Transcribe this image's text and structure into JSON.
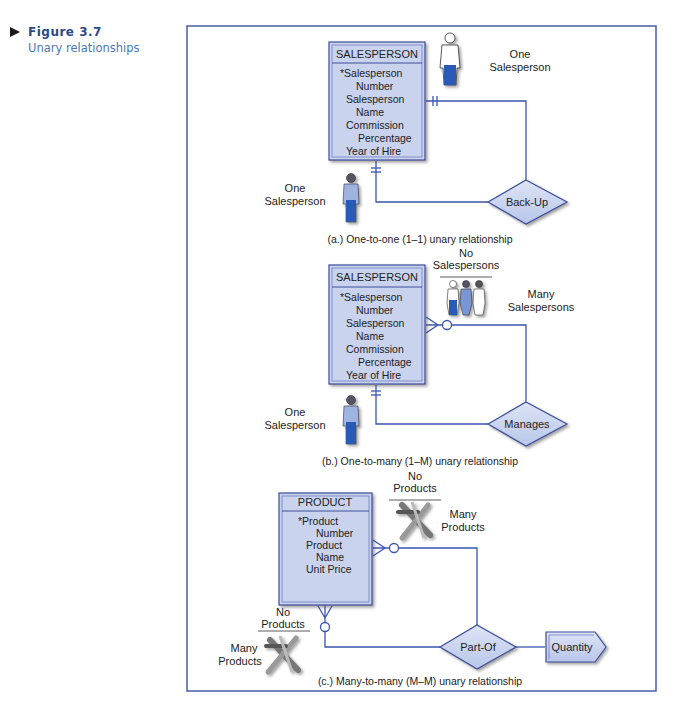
{
  "figure": {
    "number": "Figure 3.7",
    "title": "Unary relationships"
  },
  "colors": {
    "frame": "#4a5ba8",
    "entity_fill": "#c9d3ee",
    "entity_border": "#3d4e9a",
    "line": "#3a55b0",
    "figure_title": "#4a78b8"
  },
  "diagrams": [
    {
      "caption": "(a.) One-to-one (1–1) unary relationship",
      "entity": {
        "name": "SALESPERSON",
        "attributes": [
          "*Salesperson",
          "Number",
          "Salesperson",
          "Name",
          "Commission",
          "Percentage",
          "Year of Hire"
        ]
      },
      "relationship": "Back-Up",
      "label_top": {
        "line1": "One",
        "line2": "Salesperson"
      },
      "label_bottom": {
        "line1": "One",
        "line2": "Salesperson"
      }
    },
    {
      "caption": "(b.) One-to-many (1–M) unary relationship",
      "entity": {
        "name": "SALESPERSON",
        "attributes": [
          "*Salesperson",
          "Number",
          "Salesperson",
          "Name",
          "Commission",
          "Percentage",
          "Year of Hire"
        ]
      },
      "relationship": "Manages",
      "label_none": "No Salespersons",
      "label_none_l1": "No",
      "label_none_l2": "Salespersons",
      "label_many": {
        "line1": "Many",
        "line2": "Salespersons"
      },
      "label_bottom": {
        "line1": "One",
        "line2": "Salesperson"
      }
    },
    {
      "caption": "(c.) Many-to-many (M–M) unary relationship",
      "entity": {
        "name": "PRODUCT",
        "attributes": [
          "*Product",
          "Number",
          "Product",
          "Name",
          "Unit Price"
        ]
      },
      "relationship": "Part-Of",
      "attribute_box": "Quantity",
      "label_none_top": {
        "line1": "No",
        "line2": "Products"
      },
      "label_many_top": {
        "line1": "Many",
        "line2": "Products"
      },
      "label_none_bottom": {
        "line1": "No",
        "line2": "Products"
      },
      "label_many_bottom": {
        "line1": "Many",
        "line2": "Products"
      }
    }
  ]
}
